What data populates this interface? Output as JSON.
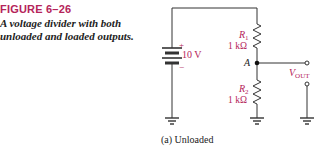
{
  "figure": {
    "label": "FIGURE 6–26",
    "caption": "A voltage divider with both unloaded and loaded outputs.",
    "accent_color": "#b5245a"
  },
  "circuit": {
    "source": {
      "plus": "+",
      "minus": "−",
      "value": "10 V"
    },
    "r1": {
      "name": "R",
      "sub": "1",
      "value": "1 kΩ"
    },
    "r2": {
      "name": "R",
      "sub": "2",
      "value": "1 kΩ"
    },
    "node": "A",
    "output": {
      "name": "V",
      "sub": "OUT"
    },
    "subcaption": "(a) Unloaded"
  }
}
